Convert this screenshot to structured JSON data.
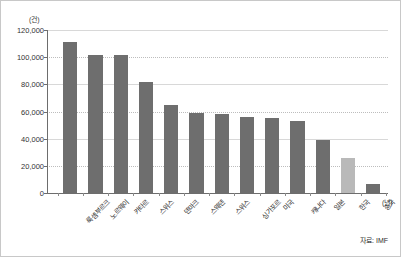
{
  "chart_data": {
    "type": "bar",
    "title": "",
    "subtitle": "",
    "xlabel": "",
    "ylabel": "",
    "unit_y": "(건)",
    "unit_x": "(년)",
    "categories": [
      "룩셈부르크",
      "노르웨이",
      "카타르",
      "스위스",
      "덴마크",
      "스웨덴",
      "스위스",
      "싱가포르",
      "미국",
      "캐나다",
      "일본",
      "한국",
      "중국"
    ],
    "values": [
      111000,
      101500,
      101500,
      82000,
      65000,
      59000,
      58000,
      56000,
      55000,
      53000,
      39000,
      25500,
      7000
    ],
    "ylim": [
      0,
      120000
    ],
    "yticks": [
      0,
      20000,
      40000,
      60000,
      80000,
      100000,
      120000
    ],
    "ytick_labels": [
      "0",
      "20,000",
      "40,000",
      "60,000",
      "80,000",
      "100,000",
      "120,000"
    ],
    "grid": true,
    "grid_axis": "y",
    "legend": false,
    "legend_position": "none",
    "bar_color": "#6e6e6e",
    "highlight_color": "#b9b9b9",
    "highlight_index": 11,
    "source": "자료: IMF"
  }
}
